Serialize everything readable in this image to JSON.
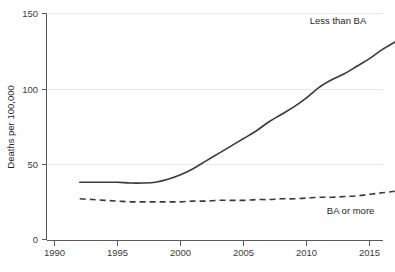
{
  "chart_data": {
    "type": "line",
    "title": "",
    "subtitle": "",
    "xlabel": "",
    "ylabel": "Deaths per 100,000",
    "xlim": [
      1990,
      2018
    ],
    "ylim": [
      0,
      150
    ],
    "yticks": [
      0,
      50,
      100,
      150
    ],
    "ytick_labels": [
      "0",
      "50",
      "100",
      "150"
    ],
    "xticks": [
      1990,
      1995,
      2000,
      2005,
      2010,
      2015
    ],
    "xtick_labels": [
      "1990",
      "1995",
      "2000",
      "2005",
      "2010",
      "2015"
    ],
    "grid": "horizontal",
    "legend_position": "inline-annotations",
    "x": [
      1992,
      1993,
      1994,
      1995,
      1996,
      1997,
      1998,
      1999,
      2000,
      2001,
      2002,
      2003,
      2004,
      2005,
      2006,
      2007,
      2008,
      2009,
      2010,
      2011,
      2012,
      2013,
      2014,
      2015,
      2016,
      2017
    ],
    "series": [
      {
        "name": "Less than BA",
        "style": "solid",
        "color": "#3a3a3a",
        "label": "Less than BA",
        "values": [
          38,
          38,
          38,
          38,
          37.5,
          37.5,
          38,
          40,
          43,
          47,
          52,
          57,
          62,
          67,
          72,
          78,
          83,
          88,
          94,
          101,
          106,
          110,
          115,
          120,
          126,
          131
        ]
      },
      {
        "name": "BA or more",
        "style": "dashed",
        "color": "#3a3a3a",
        "label": "BA or more",
        "values": [
          27,
          26.5,
          26,
          25.5,
          25,
          25,
          25,
          25,
          25,
          25.5,
          25.5,
          26,
          26,
          26,
          26.5,
          26.5,
          27,
          27,
          27.5,
          28,
          28,
          28.5,
          29,
          30,
          31,
          32
        ]
      }
    ],
    "annotations": [
      {
        "text": "Less than BA",
        "x": 2012.5,
        "y": 143
      },
      {
        "text": "BA or more",
        "x": 2013.5,
        "y": 17
      }
    ]
  },
  "colors": {
    "line": "#3a3a3a",
    "axis": "#58595b",
    "grid": "#e8e8e8",
    "text": "#231f20",
    "background": "#ffffff"
  }
}
